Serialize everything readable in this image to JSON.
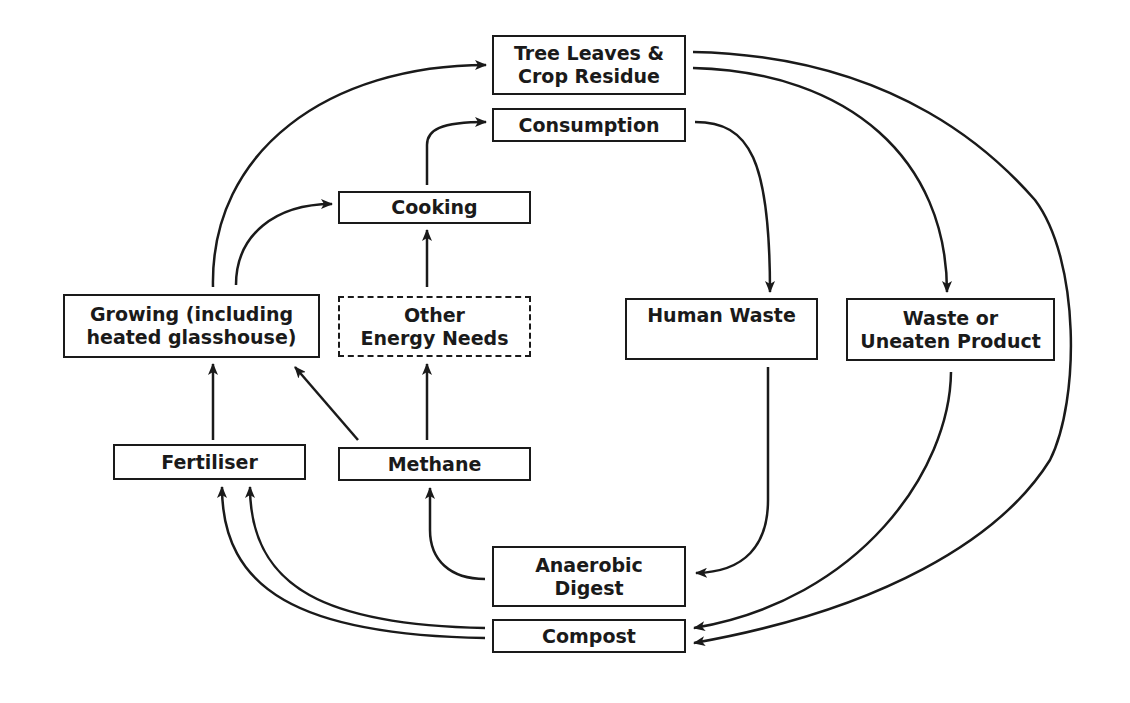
{
  "diagram": {
    "type": "flow-cycle",
    "colors": {
      "line": "#1a1a1a",
      "background": "#ffffff"
    },
    "nodes": {
      "tree_leaves": {
        "label": "Tree Leaves &\nCrop Residue",
        "style": "solid"
      },
      "consumption": {
        "label": "Consumption",
        "style": "solid"
      },
      "cooking": {
        "label": "Cooking",
        "style": "solid"
      },
      "growing": {
        "label": "Growing (including\nheated glasshouse)",
        "style": "solid"
      },
      "other_energy": {
        "label": "Other\nEnergy Needs",
        "style": "dashed"
      },
      "human_waste": {
        "label": "Human Waste",
        "style": "solid"
      },
      "waste_uneaten": {
        "label": "Waste or\nUneaten Product",
        "style": "solid"
      },
      "fertiliser": {
        "label": "Fertiliser",
        "style": "solid"
      },
      "methane": {
        "label": "Methane",
        "style": "solid"
      },
      "anaerobic": {
        "label": "Anaerobic\nDigest",
        "style": "solid"
      },
      "compost": {
        "label": "Compost",
        "style": "solid"
      }
    },
    "edges": [
      {
        "from": "growing",
        "to": "tree_leaves"
      },
      {
        "from": "growing",
        "to": "cooking"
      },
      {
        "from": "cooking",
        "to": "consumption"
      },
      {
        "from": "other_energy",
        "to": "cooking"
      },
      {
        "from": "consumption",
        "to": "human_waste"
      },
      {
        "from": "tree_leaves",
        "to": "waste_uneaten"
      },
      {
        "from": "tree_leaves",
        "to": "compost"
      },
      {
        "from": "fertiliser",
        "to": "growing"
      },
      {
        "from": "methane",
        "to": "growing"
      },
      {
        "from": "methane",
        "to": "other_energy"
      },
      {
        "from": "anaerobic",
        "to": "methane"
      },
      {
        "from": "compost",
        "to": "fertiliser"
      },
      {
        "from": "compost",
        "to": "fertiliser"
      },
      {
        "from": "human_waste",
        "to": "anaerobic"
      },
      {
        "from": "waste_uneaten",
        "to": "compost"
      }
    ]
  }
}
